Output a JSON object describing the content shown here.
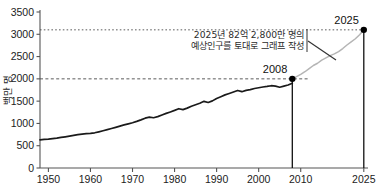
{
  "chart_data": {
    "type": "line",
    "title": "",
    "xlabel": "",
    "ylabel": "백만 명",
    "xlim": [
      1948,
      2026
    ],
    "ylim": [
      0,
      3500
    ],
    "grid": false,
    "legend": "none",
    "x_ticks": [
      "1950",
      "1960",
      "1970",
      "1980",
      "1990",
      "2000",
      "2010",
      "2025"
    ],
    "x_tick_values": [
      1950,
      1960,
      1970,
      1980,
      1990,
      2000,
      2010,
      2025
    ],
    "y_ticks": [
      "0",
      "500",
      "1000",
      "1500",
      "2000",
      "2500",
      "3000",
      "3500"
    ],
    "y_tick_values": [
      0,
      500,
      1000,
      1500,
      2000,
      2500,
      3000,
      3500
    ],
    "series": [
      {
        "name": "historical",
        "style": "solid-black",
        "x": [
          1948,
          1949,
          1950,
          1951,
          1952,
          1953,
          1954,
          1955,
          1956,
          1957,
          1958,
          1959,
          1960,
          1961,
          1962,
          1963,
          1964,
          1965,
          1966,
          1967,
          1968,
          1969,
          1970,
          1971,
          1972,
          1973,
          1974,
          1975,
          1976,
          1977,
          1978,
          1979,
          1980,
          1981,
          1982,
          1983,
          1984,
          1985,
          1986,
          1987,
          1988,
          1989,
          1990,
          1991,
          1992,
          1993,
          1994,
          1995,
          1996,
          1997,
          1998,
          1999,
          2000,
          2001,
          2002,
          2003,
          2004,
          2005,
          2006,
          2007,
          2008
        ],
        "values": [
          630,
          640,
          648,
          660,
          672,
          686,
          700,
          716,
          732,
          748,
          762,
          770,
          776,
          790,
          812,
          836,
          860,
          886,
          912,
          940,
          966,
          990,
          1016,
          1046,
          1080,
          1118,
          1140,
          1128,
          1152,
          1190,
          1226,
          1258,
          1292,
          1330,
          1310,
          1344,
          1386,
          1420,
          1452,
          1496,
          1470,
          1506,
          1560,
          1600,
          1640,
          1672,
          1706,
          1740,
          1712,
          1742,
          1758,
          1784,
          1800,
          1818,
          1830,
          1846,
          1836,
          1812,
          1836,
          1862,
          1900
        ]
      },
      {
        "name": "projection",
        "style": "light-gray",
        "x": [
          2008,
          2009,
          2010,
          2011,
          2012,
          2013,
          2014,
          2015,
          2016,
          2017,
          2018,
          2019,
          2020,
          2021,
          2022,
          2023,
          2024,
          2025
        ],
        "values": [
          2000,
          2050,
          2100,
          2160,
          2230,
          2300,
          2350,
          2420,
          2470,
          2520,
          2560,
          2610,
          2680,
          2760,
          2830,
          2900,
          2990,
          3100
        ]
      }
    ],
    "reference_lines": [
      {
        "name": "ref-2000",
        "value": 2000,
        "orientation": "horizontal",
        "style": "dashed"
      },
      {
        "name": "ref-3100",
        "value": 3100,
        "orientation": "horizontal",
        "style": "dashed"
      }
    ],
    "markers": [
      {
        "name": "marker-2008",
        "x": 2008,
        "y": 2000,
        "label": "2008"
      },
      {
        "name": "marker-2025",
        "x": 2025,
        "y": 3100,
        "label": "2025"
      }
    ],
    "annotation": {
      "line1": "2025년 82억 2,800만 명의",
      "line2": "예상인구를 토대로 그래프 작성"
    },
    "colors": {
      "line_historical": "#1a1a1a",
      "line_projection": "#b5b5b5",
      "axis": "#555555",
      "dashed": "#4a4a4a",
      "marker": "#000000",
      "text": "#1c1c1c"
    }
  }
}
